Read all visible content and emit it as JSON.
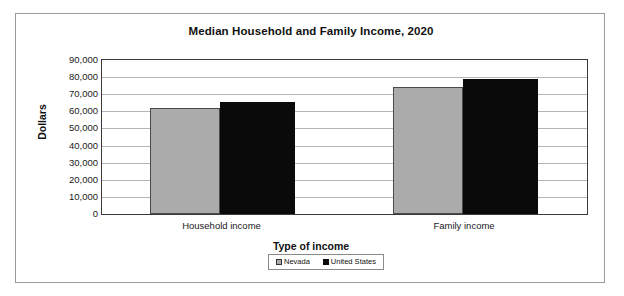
{
  "chart_data": {
    "type": "bar",
    "title": "Median Household and Family Income, 2020",
    "xlabel": "Type of income",
    "ylabel": "Dollars",
    "categories": [
      "Household income",
      "Family income"
    ],
    "series": [
      {
        "name": "Nevada",
        "values": [
          62000,
          74200
        ],
        "color": "#ababab"
      },
      {
        "name": "United States",
        "values": [
          65500,
          79000
        ],
        "color": "#0a0a0a"
      }
    ],
    "ylim": [
      0,
      90000
    ],
    "ytick_values": [
      0,
      10000,
      20000,
      30000,
      40000,
      50000,
      60000,
      70000,
      80000,
      90000
    ],
    "ytick_labels": [
      "0",
      "10,000",
      "20,000",
      "30,000",
      "40,000",
      "50,000",
      "60,000",
      "70,000",
      "80,000",
      "90,000"
    ],
    "grid": true,
    "legend_position": "bottom"
  },
  "legend": {
    "entries": [
      {
        "label": "Nevada",
        "swatch": "nevada-swatch"
      },
      {
        "label": "United States",
        "swatch": "united-states-swatch"
      }
    ]
  }
}
